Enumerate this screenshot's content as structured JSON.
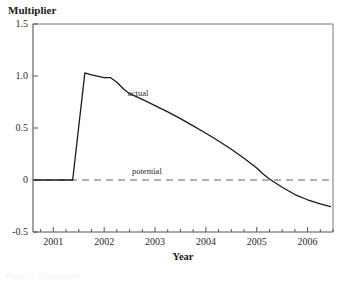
{
  "figure": {
    "y_axis_title": "Multiplier",
    "x_axis_title": "Year",
    "caption_fragment": "Figure 1. (Continued)"
  },
  "annotations": {
    "actual_label": "actual",
    "potential_label": "potential"
  },
  "colors": {
    "actual_line": "#1a1a1a",
    "potential_line": "#999999",
    "axis": "#555555",
    "text": "#1a1a1a",
    "background": "#ffffff"
  },
  "chart_data": {
    "type": "line",
    "title": "",
    "xlabel": "Year",
    "ylabel": "Multiplier",
    "xlim": [
      2000.6,
      2006.5
    ],
    "ylim": [
      -0.5,
      1.5
    ],
    "grid": false,
    "legend_position": "inline-annotation",
    "y_ticks": [
      "1.5",
      "1.0",
      "0.5",
      "0",
      "-0.5"
    ],
    "y_tick_values": [
      1.5,
      1.0,
      0.5,
      0,
      -0.5
    ],
    "x_ticks": [
      "2001",
      "2002",
      "2003",
      "2004",
      "2005",
      "2006"
    ],
    "x_tick_values": [
      2001,
      2002,
      2003,
      2004,
      2005,
      2006
    ],
    "x_minor_step": 0.25,
    "series": [
      {
        "name": "actual",
        "style": "solid",
        "color": "#1a1a1a",
        "x": [
          2000.62,
          2001.0,
          2001.25,
          2001.38,
          2001.62,
          2001.75,
          2002.0,
          2002.12,
          2002.25,
          2002.38,
          2002.5,
          2002.75,
          2003.0,
          2003.25,
          2003.5,
          2003.75,
          2004.0,
          2004.25,
          2004.5,
          2004.75,
          2005.0,
          2005.12,
          2005.25,
          2005.5,
          2005.75,
          2006.0,
          2006.25,
          2006.45
        ],
        "y": [
          0.0,
          0.0,
          0.0,
          0.0,
          1.03,
          1.01,
          0.985,
          0.985,
          0.94,
          0.875,
          0.83,
          0.775,
          0.715,
          0.655,
          0.59,
          0.52,
          0.45,
          0.375,
          0.295,
          0.21,
          0.115,
          0.06,
          0.01,
          -0.07,
          -0.14,
          -0.19,
          -0.23,
          -0.255
        ]
      },
      {
        "name": "potential",
        "style": "dashed",
        "color": "#999999",
        "x": [
          2000.62,
          2006.45
        ],
        "y": [
          0.0,
          0.0
        ]
      }
    ],
    "notes": {
      "peak_value": 1.03,
      "peak_year": 2001.62,
      "zero_crossing_year": 2005.27,
      "final_value": -0.255
    }
  }
}
